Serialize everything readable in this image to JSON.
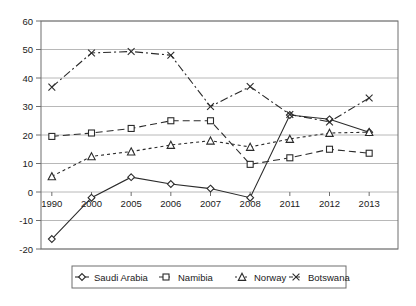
{
  "chart_data": {
    "type": "line",
    "title": "",
    "xlabel": "",
    "ylabel": "",
    "categories": [
      "1990",
      "2000",
      "2005",
      "2006",
      "2007",
      "2008",
      "2011",
      "2012",
      "2013"
    ],
    "ylim": [
      -20,
      60
    ],
    "ytick_labels": [
      "60",
      "50",
      "40",
      "30",
      "20",
      "10",
      "0",
      "-10",
      "-20"
    ],
    "yticks": [
      60,
      50,
      40,
      30,
      20,
      10,
      0,
      -10,
      -20
    ],
    "grid": true,
    "legend_position": "bottom",
    "series": [
      {
        "name": "Saudi Arabia",
        "marker": "diamond",
        "dash": "solid",
        "values": [
          -16.5,
          -2.0,
          5.2,
          2.8,
          1.2,
          -2.0,
          27.0,
          25.5,
          21.0
        ]
      },
      {
        "name": "Namibia",
        "marker": "square",
        "dash": "dashed",
        "values": [
          19.5,
          20.7,
          22.3,
          25.0,
          25.0,
          9.7,
          12.0,
          15.0,
          13.6
        ]
      },
      {
        "name": "Norway",
        "marker": "triangle",
        "dash": "dotted",
        "values": [
          5.5,
          12.5,
          14.2,
          16.5,
          18.0,
          15.8,
          18.6,
          20.7,
          21.0
        ]
      },
      {
        "name": "Botswana",
        "marker": "cross",
        "dash": "dashdot",
        "values": [
          36.8,
          48.8,
          49.3,
          48.0,
          30.0,
          37.0,
          27.2,
          24.6,
          33.0
        ]
      }
    ]
  },
  "legend": {
    "items": [
      {
        "label": "Saudi Arabia"
      },
      {
        "label": "Namibia"
      },
      {
        "label": "Norway"
      },
      {
        "label": "Botswana"
      }
    ]
  }
}
